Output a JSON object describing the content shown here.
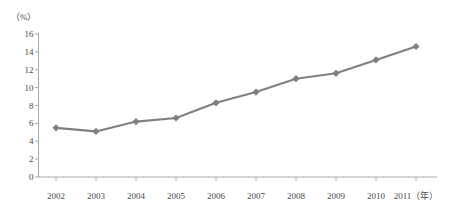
{
  "chart_data": {
    "type": "line",
    "title": "",
    "subtitle": "",
    "xlabel": "（年）",
    "ylabel": "（%）",
    "categories": [
      "2002",
      "2003",
      "2004",
      "2005",
      "2006",
      "2007",
      "2008",
      "2009",
      "2010",
      "2011"
    ],
    "values": [
      5.5,
      5.1,
      6.2,
      6.6,
      8.3,
      9.5,
      11.0,
      11.6,
      13.1,
      14.6
    ],
    "series": [
      {
        "name": "",
        "values": [
          5.5,
          5.1,
          6.2,
          6.6,
          8.3,
          9.5,
          11.0,
          11.6,
          13.1,
          14.6
        ]
      }
    ],
    "ylim": [
      0,
      16
    ],
    "ytick_step": 2,
    "yticks": [
      "16",
      "14",
      "12",
      "10",
      "8",
      "6",
      "4",
      "2",
      "0"
    ],
    "xtick_labels": [
      "2002",
      "2003",
      "2004",
      "2005",
      "2006",
      "2007",
      "2008",
      "2009",
      "2010",
      "2011（年）"
    ],
    "grid": false,
    "legend": false,
    "legend_position": "none",
    "marker": "diamond",
    "line_color": "#808080",
    "marker_color": "#808080",
    "axis_color": "#a8a8a8",
    "background_color": "#ffffff"
  }
}
